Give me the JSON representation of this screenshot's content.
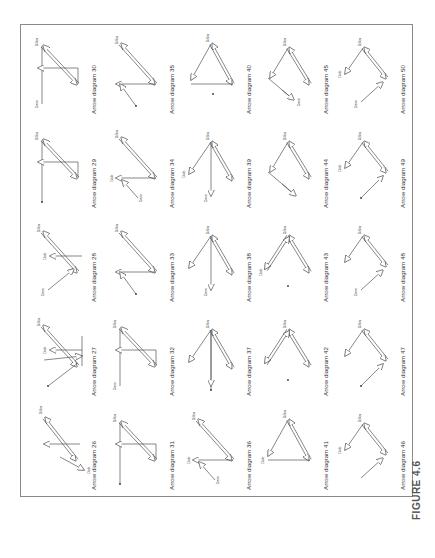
{
  "figure": {
    "caption": "FIGURE 4.6",
    "orientation": "rotated 90deg counter-clockwise",
    "frame_color": "#8a8a8a",
    "line_color": "#555555"
  },
  "diagrams": [
    {
      "id": 26,
      "label": "Arrow diagram 26",
      "column": 0,
      "row": 4,
      "shape": "v-fork-down-two-pointers"
    },
    {
      "id": 27,
      "label": "Arrow diagram 27",
      "column": 0,
      "row": 3,
      "shape": "fork-with-long-tail"
    },
    {
      "id": 28,
      "label": "Arrow diagram 28",
      "column": 0,
      "row": 2,
      "shape": "fork-with-labeled-tail"
    },
    {
      "id": 29,
      "label": "Arrow diagram 29",
      "column": 0,
      "row": 1,
      "shape": "cross-dot-tail"
    },
    {
      "id": 30,
      "label": "Arrow diagram 30",
      "column": 0,
      "row": 0,
      "shape": "cross-labeled-tail"
    },
    {
      "id": 31,
      "label": "Arrow diagram 31",
      "column": 1,
      "row": 4,
      "shape": "cross-dot-tail"
    },
    {
      "id": 32,
      "label": "Arrow diagram 32",
      "column": 1,
      "row": 3,
      "shape": "cross-labeled-tail"
    },
    {
      "id": 33,
      "label": "Arrow diagram 33",
      "column": 1,
      "row": 2,
      "shape": "zigzag-dot-tail"
    },
    {
      "id": 34,
      "label": "Arrow diagram 34",
      "column": 1,
      "row": 1,
      "shape": "zigzag-labeled-tail"
    },
    {
      "id": 35,
      "label": "Arrow diagram 35",
      "column": 1,
      "row": 0,
      "shape": "zigzag-dot-tail"
    },
    {
      "id": 36,
      "label": "Arrow diagram 36",
      "column": 2,
      "row": 4,
      "shape": "zigzag-labeled-tail"
    },
    {
      "id": 37,
      "label": "Arrow diagram 37",
      "column": 2,
      "row": 3,
      "shape": "star-dot-tail"
    },
    {
      "id": 38,
      "label": "Arrow diagram 38",
      "column": 2,
      "row": 2,
      "shape": "star-labeled-tail"
    },
    {
      "id": 39,
      "label": "Arrow diagram 39",
      "column": 2,
      "row": 1,
      "shape": "star-labeled-both"
    },
    {
      "id": 40,
      "label": "Arrow diagram 40",
      "column": 2,
      "row": 0,
      "shape": "triangle-isolated-dot"
    },
    {
      "id": 41,
      "label": "Arrow diagram 41",
      "column": 3,
      "row": 4,
      "shape": "triangle-labeled"
    },
    {
      "id": 42,
      "label": "Arrow diagram 42",
      "column": 3,
      "row": 3,
      "shape": "v-isolated-dot"
    },
    {
      "id": 43,
      "label": "Arrow diagram 43",
      "column": 3,
      "row": 2,
      "shape": "v-isolated-dot-labeled"
    },
    {
      "id": 44,
      "label": "Arrow diagram 44",
      "column": 3,
      "row": 1,
      "shape": "chain-dot-tail"
    },
    {
      "id": 45,
      "label": "Arrow diagram 45",
      "column": 3,
      "row": 0,
      "shape": "chain-labeled-tail"
    },
    {
      "id": 46,
      "label": "Arrow diagram 46",
      "column": 4,
      "row": 4,
      "shape": "fork-labeled"
    },
    {
      "id": 47,
      "label": "Arrow diagram 47",
      "column": 4,
      "row": 3,
      "shape": "fork-dot-tail"
    },
    {
      "id": 48,
      "label": "Arrow diagram 48",
      "column": 4,
      "row": 2,
      "shape": "fork-labeled-tail"
    },
    {
      "id": 49,
      "label": "Arrow diagram 49",
      "column": 4,
      "row": 1,
      "shape": "fork-dot-tail-labeled"
    },
    {
      "id": 50,
      "label": "Arrow diagram 50",
      "column": 4,
      "row": 0,
      "shape": "fork-labeled-tail-labeled"
    }
  ],
  "node_labels": {
    "hub": "Dillon",
    "tail": "Dave",
    "branch": "Dale"
  }
}
